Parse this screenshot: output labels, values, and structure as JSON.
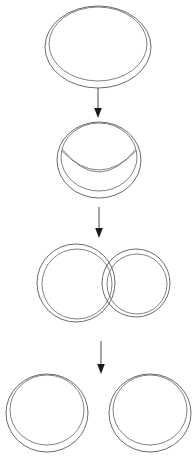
{
  "figure": {
    "background_color": "#ffffff",
    "line_color": "#595959",
    "arrow_color": "#1a1a1a",
    "stage_count": 4,
    "arrow_count": 3
  },
  "stages": [
    {
      "index": 1,
      "name": "intact-ring",
      "label": "Intact torus",
      "shape": "double-ring",
      "ring_count": 1,
      "center_x": 98,
      "center_y": 47,
      "outer_rx": 53,
      "outer_ry": 41,
      "tube_offset": 4
    },
    {
      "index": 2,
      "name": "pinching-ring",
      "label": "Pinching torus with inner crescent",
      "shape": "double-ring-with-crescent",
      "ring_count": 1,
      "center_x": 99,
      "center_y": 160,
      "outer_rx": 42,
      "outer_ry": 38,
      "tube_offset": 4,
      "crescent_sag": 20
    },
    {
      "index": 3,
      "name": "overlapping-rings",
      "label": "Two overlapping rings",
      "shape": "double-ring",
      "ring_count": 2,
      "rings": [
        {
          "center_x": 76,
          "center_y": 283,
          "outer_rx": 39,
          "outer_ry": 39,
          "tube_offset": 4
        },
        {
          "center_x": 136,
          "center_y": 283,
          "outer_rx": 34,
          "outer_ry": 34,
          "tube_offset": 4
        }
      ]
    },
    {
      "index": 4,
      "name": "separated-rings",
      "label": "Two separated rings",
      "shape": "double-ring",
      "ring_count": 2,
      "rings": [
        {
          "center_x": 47,
          "center_y": 413,
          "outer_rx": 41,
          "outer_ry": 39,
          "tube_offset": 4
        },
        {
          "center_x": 150,
          "center_y": 413,
          "outer_rx": 41,
          "outer_ry": 39,
          "tube_offset": 4
        }
      ]
    }
  ],
  "arrows": [
    {
      "index": 1,
      "name": "arrow-stage1-to-stage2",
      "x": 98,
      "y_start": 88,
      "y_end": 118,
      "direction": "down"
    },
    {
      "index": 2,
      "name": "arrow-stage2-to-stage3",
      "x": 99,
      "y_start": 207,
      "y_end": 238,
      "direction": "down"
    },
    {
      "index": 3,
      "name": "arrow-stage3-to-stage4",
      "x": 101,
      "y_start": 341,
      "y_end": 374,
      "direction": "down"
    }
  ]
}
